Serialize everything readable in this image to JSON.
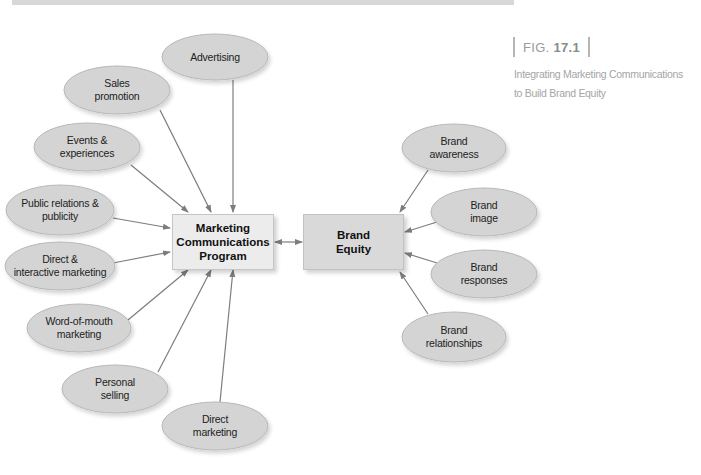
{
  "figure": {
    "label_prefix": "FIG.",
    "label_number": "17.1",
    "caption_line1": "Integrating Marketing Communications",
    "caption_line2": "to Build Brand Equity"
  },
  "colors": {
    "ellipse_fill": "#d4d4d4",
    "ellipse_stroke": "#b8b8b8",
    "arrow": "#7d7d7d",
    "mcp_box_fill": "#ececec",
    "brand_equity_box_fill": "#d9d9d9",
    "caption_text": "#a5a5a5"
  },
  "center_nodes": {
    "program": {
      "line1": "Marketing",
      "line2": "Communications",
      "line3": "Program"
    },
    "equity": {
      "line1": "Brand",
      "line2": "Equity"
    }
  },
  "communication_options": [
    {
      "id": "advertising",
      "line1": "Advertising",
      "line2": ""
    },
    {
      "id": "sales-promotion",
      "line1": "Sales",
      "line2": "promotion"
    },
    {
      "id": "events-experiences",
      "line1": "Events &",
      "line2": "experiences"
    },
    {
      "id": "public-relations",
      "line1": "Public relations &",
      "line2": "publicity"
    },
    {
      "id": "direct-interactive",
      "line1": "Direct &",
      "line2": "interactive marketing"
    },
    {
      "id": "word-of-mouth",
      "line1": "Word-of-mouth",
      "line2": "marketing"
    },
    {
      "id": "personal-selling",
      "line1": "Personal",
      "line2": "selling"
    },
    {
      "id": "direct-marketing",
      "line1": "Direct",
      "line2": "marketing"
    }
  ],
  "brand_components": [
    {
      "id": "brand-awareness",
      "line1": "Brand",
      "line2": "awareness"
    },
    {
      "id": "brand-image",
      "line1": "Brand",
      "line2": "image"
    },
    {
      "id": "brand-responses",
      "line1": "Brand",
      "line2": "responses"
    },
    {
      "id": "brand-relationships",
      "line1": "Brand",
      "line2": "relationships"
    }
  ]
}
